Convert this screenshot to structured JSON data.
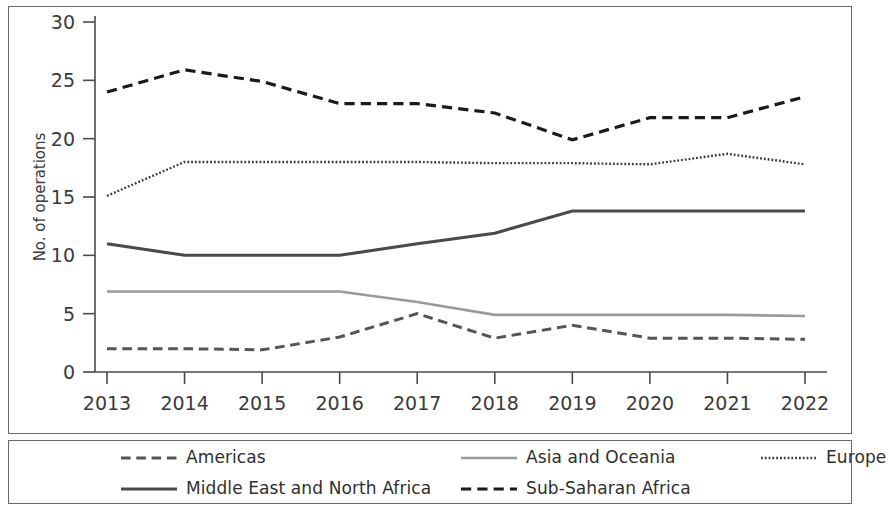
{
  "chart_data": {
    "type": "line",
    "title": "",
    "xlabel": "",
    "ylabel": "No. of operations",
    "categories": [
      "2013",
      "2014",
      "2015",
      "2016",
      "2017",
      "2018",
      "2019",
      "2020",
      "2021",
      "2022"
    ],
    "x": [
      2013,
      2014,
      2015,
      2016,
      2017,
      2018,
      2019,
      2020,
      2021,
      2022
    ],
    "ylim": [
      0,
      30
    ],
    "yticks": [
      0,
      5,
      10,
      15,
      20,
      25,
      30
    ],
    "grid": false,
    "legend_position": "bottom",
    "series": [
      {
        "name": "Americas",
        "style": "dashed",
        "color": "#555555",
        "width": 3.0,
        "values": [
          2.0,
          2.0,
          1.9,
          3.0,
          5.0,
          2.9,
          4.0,
          2.9,
          2.9,
          2.8
        ]
      },
      {
        "name": "Middle East and North Africa",
        "style": "solid",
        "color": "#4a4a4a",
        "width": 3.0,
        "values": [
          11.0,
          10.0,
          10.0,
          10.0,
          11.0,
          11.9,
          13.8,
          13.8,
          13.8,
          13.8
        ]
      },
      {
        "name": "Asia and Oceania",
        "style": "solid",
        "color": "#9a9a9a",
        "width": 2.6,
        "values": [
          6.9,
          6.9,
          6.9,
          6.9,
          6.0,
          4.9,
          4.9,
          4.9,
          4.9,
          4.8
        ]
      },
      {
        "name": "Sub-Saharan Africa",
        "style": "dashed",
        "color": "#1a1a1a",
        "width": 3.2,
        "values": [
          24.0,
          25.9,
          24.9,
          23.0,
          23.0,
          22.2,
          19.9,
          21.8,
          21.8,
          23.6
        ]
      },
      {
        "name": "Europe",
        "style": "dotted",
        "color": "#3a3a3a",
        "width": 2.4,
        "values": [
          15.1,
          18.0,
          18.0,
          18.0,
          18.0,
          17.9,
          17.9,
          17.8,
          18.7,
          17.8
        ]
      }
    ]
  },
  "axis": {
    "y_label": "No. of operations",
    "y_ticks": [
      "0",
      "5",
      "10",
      "15",
      "20",
      "25",
      "30"
    ],
    "x_ticks": [
      "2013",
      "2014",
      "2015",
      "2016",
      "2017",
      "2018",
      "2019",
      "2020",
      "2021",
      "2022"
    ]
  },
  "legend": {
    "items": [
      {
        "label": "Americas",
        "style": "dashed",
        "color": "#555555"
      },
      {
        "label": "Middle East and North Africa",
        "style": "solid",
        "color": "#4a4a4a"
      },
      {
        "label": "Asia and Oceania",
        "style": "solid",
        "color": "#9a9a9a"
      },
      {
        "label": "Sub-Saharan Africa",
        "style": "dashed",
        "color": "#1a1a1a"
      },
      {
        "label": "Europe",
        "style": "dotted",
        "color": "#3a3a3a"
      }
    ]
  },
  "colors": {
    "frame": "#6a6a6a",
    "axis": "#4a4a4a",
    "text": "#3a3a3a",
    "background": "#ffffff"
  }
}
